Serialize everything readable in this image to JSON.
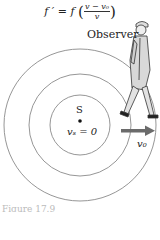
{
  "formula": {
    "lhs": "f ′ = f",
    "numerator": "v − v₀",
    "denominator": "v"
  },
  "labels": {
    "observer": "Observer",
    "source": "S",
    "source_velocity": "vₛ = 0",
    "observer_velocity": "v₀"
  },
  "caption": "Figure 17.9",
  "diagram": {
    "center": [
      80,
      125
    ],
    "wavefront_radii": [
      30,
      51,
      76
    ],
    "circle_color": "#8a8a8a",
    "arrow_color": "#6b6b6b",
    "arrow_direction": "right"
  }
}
